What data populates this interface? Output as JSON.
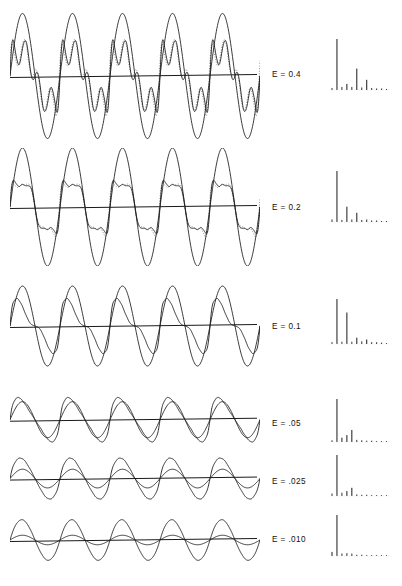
{
  "figure": {
    "type": "multi-panel-waveform-spectrum",
    "panel_count": 6,
    "background_color": "#ffffff",
    "line_color": "#1a1a1a",
    "dotted_color": "#8a8a8a"
  },
  "panels": [
    {
      "label": "E = 0.4",
      "label_x": 272,
      "label_y": 70,
      "panel_top": 8,
      "panel_height": 136,
      "wave_baseline_frac": 0.5,
      "cycles": 5,
      "waveform": {
        "style": "complex-multilobe",
        "harmonic_amplitudes": [
          1.0,
          0.1,
          0.12,
          0.55,
          0.13,
          0.1,
          0.05,
          0.04,
          0.03,
          0.02
        ],
        "envelope_amplitude": 0.46,
        "has_dotted_overlay": true,
        "peak_amplitude": 0.95
      },
      "spectrum": {
        "x": 330,
        "y": 36,
        "width": 62,
        "height": 56,
        "values": [
          0.04,
          1.0,
          0.06,
          0.12,
          0.06,
          0.42,
          0.05,
          0.2,
          0.04,
          0.03,
          0.03,
          0.02
        ]
      }
    },
    {
      "label": "E = 0.2",
      "label_x": 272,
      "label_y": 203,
      "panel_top": 148,
      "panel_height": 118,
      "wave_baseline_frac": 0.5,
      "cycles": 5,
      "waveform": {
        "style": "double-peak",
        "harmonic_amplitudes": [
          1.0,
          0.08,
          0.3,
          0.1,
          0.14,
          0.05,
          0.03,
          0.02,
          0.02,
          0.01
        ],
        "envelope_amplitude": 0.5,
        "has_dotted_overlay": true,
        "peak_amplitude": 0.88
      },
      "spectrum": {
        "x": 330,
        "y": 168,
        "width": 62,
        "height": 56,
        "values": [
          0.05,
          1.0,
          0.04,
          0.3,
          0.05,
          0.18,
          0.04,
          0.05,
          0.03,
          0.03,
          0.02,
          0.02
        ]
      }
    },
    {
      "label": "E = 0.1",
      "label_x": 272,
      "label_y": 322,
      "panel_top": 278,
      "panel_height": 100,
      "wave_baseline_frac": 0.48,
      "cycles": 5,
      "waveform": {
        "style": "asymmetric-spike",
        "harmonic_amplitudes": [
          1.0,
          0.55,
          0.14,
          0.1,
          0.06,
          0.04,
          0.03,
          0.02,
          0.02,
          0.01
        ],
        "envelope_amplitude": 0.4,
        "has_dotted_overlay": false,
        "peak_amplitude": 0.92
      },
      "spectrum": {
        "x": 330,
        "y": 296,
        "width": 62,
        "height": 50,
        "values": [
          0.04,
          1.0,
          0.05,
          0.7,
          0.05,
          0.14,
          0.06,
          0.1,
          0.04,
          0.04,
          0.03,
          0.02
        ]
      }
    },
    {
      "label": "E = .05",
      "label_x": 272,
      "label_y": 419,
      "panel_top": 382,
      "panel_height": 82,
      "wave_baseline_frac": 0.46,
      "cycles": 5,
      "waveform": {
        "style": "tilted-sine",
        "harmonic_amplitudes": [
          1.0,
          0.3,
          0.1,
          0.05,
          0.03,
          0.02,
          0.02,
          0.01,
          0.01,
          0.01
        ],
        "envelope_amplitude": 0.22,
        "has_dotted_overlay": false,
        "peak_amplitude": 0.85
      },
      "spectrum": {
        "x": 330,
        "y": 396,
        "width": 62,
        "height": 48,
        "values": [
          0.04,
          1.0,
          0.1,
          0.16,
          0.28,
          0.05,
          0.04,
          0.03,
          0.03,
          0.02,
          0.02,
          0.02
        ]
      }
    },
    {
      "label": "E = .025",
      "label_x": 272,
      "label_y": 477,
      "panel_top": 444,
      "panel_height": 72,
      "wave_baseline_frac": 0.48,
      "cycles": 5,
      "waveform": {
        "style": "near-sine",
        "harmonic_amplitudes": [
          1.0,
          0.16,
          0.05,
          0.03,
          0.02,
          0.01,
          0.01,
          0.01,
          0.0,
          0.0
        ],
        "envelope_amplitude": 0.13,
        "has_dotted_overlay": false,
        "peak_amplitude": 0.8
      },
      "spectrum": {
        "x": 330,
        "y": 452,
        "width": 62,
        "height": 46,
        "values": [
          0.06,
          1.0,
          0.08,
          0.12,
          0.2,
          0.04,
          0.03,
          0.03,
          0.02,
          0.02,
          0.02,
          0.02
        ]
      }
    },
    {
      "label": "E = .010",
      "label_x": 272,
      "label_y": 535,
      "panel_top": 506,
      "panel_height": 68,
      "wave_baseline_frac": 0.5,
      "cycles": 5,
      "waveform": {
        "style": "pure-sine",
        "harmonic_amplitudes": [
          1.0,
          0.06,
          0.02,
          0.01,
          0.01,
          0.0,
          0.0,
          0.0,
          0.0,
          0.0
        ],
        "envelope_amplitude": 0.07,
        "has_dotted_overlay": false,
        "peak_amplitude": 0.72
      },
      "spectrum": {
        "x": 330,
        "y": 512,
        "width": 62,
        "height": 46,
        "values": [
          0.1,
          1.0,
          0.06,
          0.07,
          0.06,
          0.03,
          0.03,
          0.02,
          0.02,
          0.02,
          0.02,
          0.02
        ]
      }
    }
  ],
  "chart_data": {
    "type": "line",
    "title": "",
    "xlabel": "",
    "ylabel": "",
    "series": [
      {
        "name": "E = 0.4",
        "spectrum": [
          0.04,
          1.0,
          0.06,
          0.12,
          0.06,
          0.42,
          0.05,
          0.2,
          0.04,
          0.03,
          0.03,
          0.02
        ]
      },
      {
        "name": "E = 0.2",
        "spectrum": [
          0.05,
          1.0,
          0.04,
          0.3,
          0.05,
          0.18,
          0.04,
          0.05,
          0.03,
          0.03,
          0.02,
          0.02
        ]
      },
      {
        "name": "E = 0.1",
        "spectrum": [
          0.04,
          1.0,
          0.05,
          0.7,
          0.05,
          0.14,
          0.06,
          0.1,
          0.04,
          0.04,
          0.03,
          0.02
        ]
      },
      {
        "name": "E = .05",
        "spectrum": [
          0.04,
          1.0,
          0.1,
          0.16,
          0.28,
          0.05,
          0.04,
          0.03,
          0.03,
          0.02,
          0.02,
          0.02
        ]
      },
      {
        "name": "E = .025",
        "spectrum": [
          0.06,
          1.0,
          0.08,
          0.12,
          0.2,
          0.04,
          0.03,
          0.03,
          0.02,
          0.02,
          0.02,
          0.02
        ]
      },
      {
        "name": "E = .010",
        "spectrum": [
          0.1,
          1.0,
          0.06,
          0.07,
          0.06,
          0.03,
          0.03,
          0.02,
          0.02,
          0.02,
          0.02,
          0.02
        ]
      }
    ],
    "categories": [
      "0",
      "1",
      "2",
      "3",
      "4",
      "5",
      "6",
      "7",
      "8",
      "9",
      "10",
      "11"
    ],
    "legend_position": "center-inline",
    "grid": false
  }
}
